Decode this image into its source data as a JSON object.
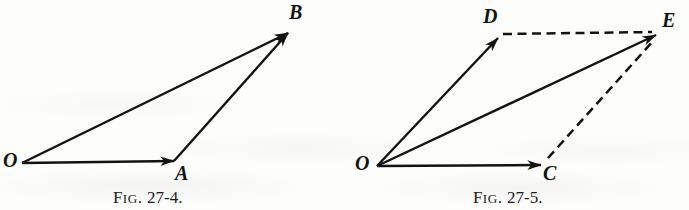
{
  "page": {
    "background_color": "#fdfdfc",
    "ink_color": "#131313",
    "width": 689,
    "height": 210
  },
  "figures": [
    {
      "id": "fig-27-4",
      "caption": {
        "lead_letter": "F",
        "lead_small_caps": "IG",
        "lead_period": ".",
        "number": "27-4.",
        "full_text": "FIG. 27-4."
      },
      "type": "vector-triangle-head-to-tail",
      "points": {
        "O": {
          "label": "O",
          "x": 22,
          "y": 163
        },
        "A": {
          "label": "A",
          "x": 174,
          "y": 161
        },
        "B": {
          "label": "B",
          "x": 288,
          "y": 33
        }
      },
      "label_positions": {
        "O": {
          "x": 3,
          "y": 150
        },
        "A": {
          "x": 175,
          "y": 163
        },
        "B": {
          "x": 289,
          "y": 2
        }
      },
      "edges": [
        {
          "name": "O-to-A",
          "from": "O",
          "to": "A",
          "style": "solid",
          "arrow": true
        },
        {
          "name": "A-to-B",
          "from": "A",
          "to": "B",
          "style": "solid",
          "arrow": true
        },
        {
          "name": "O-to-B",
          "from": "O",
          "to": "B",
          "style": "solid",
          "arrow": true
        }
      ]
    },
    {
      "id": "fig-27-5",
      "caption": {
        "lead_letter": "F",
        "lead_small_caps": "IG",
        "lead_period": ".",
        "number": "27-5.",
        "full_text": "FIG. 27-5."
      },
      "type": "vector-parallelogram-rule",
      "points": {
        "O": {
          "label": "O",
          "x": 377,
          "y": 166
        },
        "C": {
          "label": "C",
          "x": 541,
          "y": 165
        },
        "D": {
          "label": "D",
          "x": 498,
          "y": 38
        },
        "E": {
          "label": "E",
          "x": 656,
          "y": 35
        }
      },
      "label_positions": {
        "O": {
          "x": 355,
          "y": 153
        },
        "C": {
          "x": 543,
          "y": 163
        },
        "D": {
          "x": 483,
          "y": 6
        },
        "E": {
          "x": 662,
          "y": 10
        }
      },
      "edges": [
        {
          "name": "O-to-D",
          "from": "O",
          "to": "D",
          "style": "solid",
          "arrow": true
        },
        {
          "name": "O-to-C",
          "from": "O",
          "to": "C",
          "style": "solid",
          "arrow": true
        },
        {
          "name": "O-to-E",
          "from": "O",
          "to": "E",
          "style": "solid",
          "arrow": true
        },
        {
          "name": "D-to-E",
          "from": "D",
          "to": "E",
          "style": "dashed",
          "arrow": false
        },
        {
          "name": "C-to-E",
          "from": "C",
          "to": "E",
          "style": "dashed",
          "arrow": false
        }
      ]
    }
  ]
}
